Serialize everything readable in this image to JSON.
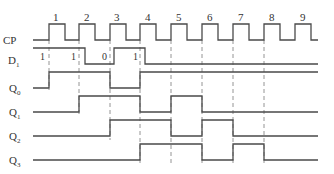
{
  "diagram": {
    "type": "timing-diagram",
    "signals": [
      {
        "name": "CP",
        "label_main": "CP",
        "label_sub": ""
      },
      {
        "name": "D1",
        "label_main": "D",
        "label_sub": "1"
      },
      {
        "name": "Q0",
        "label_main": "Q",
        "label_sub": "0"
      },
      {
        "name": "Q1",
        "label_main": "Q",
        "label_sub": "1"
      },
      {
        "name": "Q2",
        "label_main": "Q",
        "label_sub": "2"
      },
      {
        "name": "Q3",
        "label_main": "Q",
        "label_sub": "3"
      }
    ],
    "clock_pulses": [
      "1",
      "2",
      "3",
      "4",
      "5",
      "6",
      "7",
      "8",
      "9"
    ],
    "d1_sampled_values": [
      "1",
      "1",
      "0",
      "1"
    ],
    "colors": {
      "line": "#4a4a4a",
      "dash": "#7a7a7a",
      "text": "#333333"
    }
  }
}
